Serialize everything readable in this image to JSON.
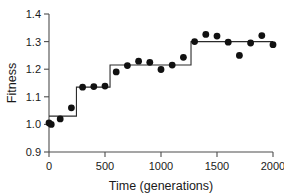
{
  "chart_data": {
    "type": "scatter",
    "title": "",
    "xlabel": "Time (generations)",
    "ylabel": "Fitness",
    "xlim": [
      0,
      2000
    ],
    "ylim": [
      0.9,
      1.4
    ],
    "grid": false,
    "legend": null,
    "xticks": [
      0,
      500,
      1000,
      1500,
      2000
    ],
    "xtick_labels": [
      "0",
      "500",
      "1000",
      "1500",
      "2000"
    ],
    "yticks": [
      0.9,
      1.0,
      1.1,
      1.2,
      1.3,
      1.4
    ],
    "ytick_labels": [
      "0.9",
      "1.0",
      "1.1",
      "1.2",
      "1.3",
      "1.4"
    ],
    "series": [
      {
        "name": "Fitness measurements",
        "marker": "filled-circle",
        "color": "#111111",
        "x": [
          0,
          20,
          100,
          200,
          300,
          400,
          500,
          600,
          700,
          800,
          900,
          1000,
          1100,
          1200,
          1300,
          1400,
          1500,
          1600,
          1700,
          1800,
          1900,
          2000
        ],
        "values": [
          1.005,
          1.0,
          1.02,
          1.06,
          1.135,
          1.137,
          1.139,
          1.19,
          1.213,
          1.229,
          1.225,
          1.199,
          1.215,
          1.243,
          1.3,
          1.326,
          1.32,
          1.298,
          1.25,
          1.295,
          1.322,
          1.289
        ]
      },
      {
        "name": "Step fit",
        "marker": "none",
        "color": "#2b2b2b",
        "steps": [
          {
            "x_start": 0,
            "x_end": 245,
            "y": 1.03
          },
          {
            "x_start": 245,
            "x_end": 545,
            "y": 1.135
          },
          {
            "x_start": 545,
            "x_end": 1268,
            "y": 1.215
          },
          {
            "x_start": 1268,
            "x_end": 2000,
            "y": 1.3
          }
        ]
      }
    ]
  }
}
